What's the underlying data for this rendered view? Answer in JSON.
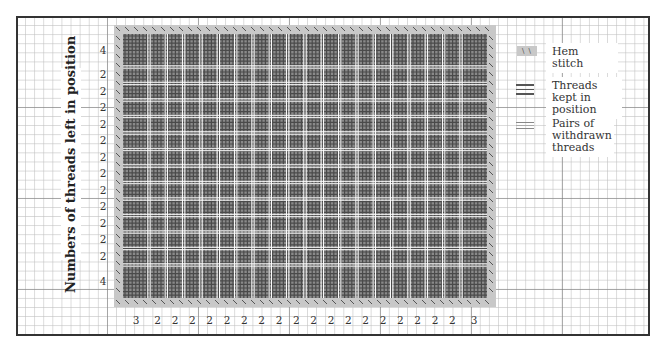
{
  "y_axis_label": "Numbers of threads left in position",
  "row_labels": [
    "4",
    "2",
    "2",
    "2",
    "2",
    "2",
    "2",
    "2",
    "2",
    "2",
    "2",
    "2",
    "2",
    "4"
  ],
  "column_labels": [
    "3",
    "2",
    "2",
    "2",
    "2",
    "2",
    "2",
    "2",
    "2",
    "2",
    "2",
    "2",
    "2",
    "2",
    "2",
    "2",
    "2",
    "2",
    "2",
    "3"
  ],
  "legend": [
    {
      "symbol": "hem-stitch",
      "label": "Hem stitch"
    },
    {
      "symbol": "threads-kept",
      "label": "Threads kept in position"
    },
    {
      "symbol": "withdrawn-pairs",
      "label": "Pairs of withdrawn threads"
    }
  ],
  "colors": {
    "hem_border": "#c8c8c8",
    "kept_dark": "#4a4a4a",
    "cell_gray": "#8a8a8a",
    "withdrawn": "#ffffff",
    "frame": "#333333"
  }
}
